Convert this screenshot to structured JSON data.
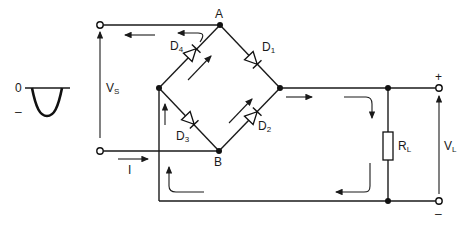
{
  "diagram": {
    "type": "full-wave bridge rectifier",
    "nodes": {
      "A": "A",
      "B": "B"
    },
    "diodes": [
      {
        "id": "D1",
        "label": "D",
        "sub": "1"
      },
      {
        "id": "D2",
        "label": "D",
        "sub": "2"
      },
      {
        "id": "D3",
        "label": "D",
        "sub": "3"
      },
      {
        "id": "D4",
        "label": "D",
        "sub": "4"
      }
    ],
    "source": {
      "voltage_label": "V",
      "voltage_sub": "S",
      "current_label": "I"
    },
    "load": {
      "resistor_label": "R",
      "resistor_sub": "L",
      "voltage_label": "V",
      "voltage_sub": "L",
      "plus": "+",
      "minus": "–"
    },
    "waveform": {
      "zero_label": "0",
      "minus_label": "–",
      "description": "negative half-cycle"
    }
  }
}
